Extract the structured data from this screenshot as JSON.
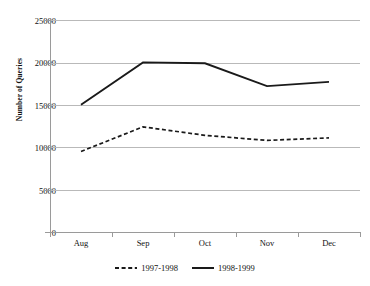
{
  "chart_data": {
    "type": "line",
    "title": "",
    "xlabel": "",
    "ylabel": "Number of Queries",
    "categories": [
      "Aug",
      "Sep",
      "Oct",
      "Nov",
      "Dec"
    ],
    "ylim": [
      0,
      25000
    ],
    "ytick_values": [
      0,
      5000,
      10000,
      15000,
      20000,
      25000
    ],
    "ytick_labels": [
      "0",
      "5000",
      "10000",
      "15000",
      "20000",
      "25000"
    ],
    "grid": true,
    "legend_position": "bottom",
    "series": [
      {
        "name": "1997-1998",
        "style": "dashed",
        "color": "#1a1a1a",
        "values": [
          9500,
          12400,
          11400,
          10800,
          11100
        ]
      },
      {
        "name": "1998-1999",
        "style": "solid",
        "color": "#1a1a1a",
        "values": [
          15000,
          20000,
          19900,
          17200,
          17700
        ]
      }
    ]
  },
  "axis": {
    "y_title": "Number of Queries",
    "y_labels": {
      "t0": "0",
      "t1": "5000",
      "t2": "10000",
      "t3": "15000",
      "t4": "20000",
      "t5": "25000"
    },
    "x_labels": {
      "c0": "Aug",
      "c1": "Sep",
      "c2": "Oct",
      "c3": "Nov",
      "c4": "Dec"
    }
  },
  "legend": {
    "item0": "1997-1998",
    "item1": "1998-1999"
  }
}
